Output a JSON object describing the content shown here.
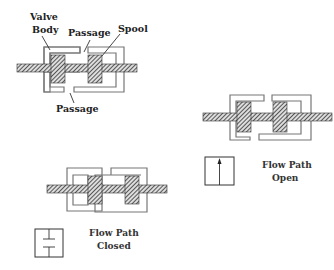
{
  "figure": {
    "labels": {
      "valve_body_line1": "Valve",
      "valve_body_line2": "Body",
      "passage_top": "Passage",
      "spool": "Spool",
      "passage_bottom": "Passage"
    },
    "open_caption": {
      "line1": "Flow Path",
      "line2": "Open"
    },
    "closed_caption": {
      "line1": "Flow Path",
      "line2": "Closed"
    },
    "symbols": {
      "open": "arrow-up-icon",
      "closed": "blocked-path-icon"
    },
    "colors": {
      "ink": "#333333",
      "body_outline": "#777777",
      "hatch": "#444444"
    }
  }
}
